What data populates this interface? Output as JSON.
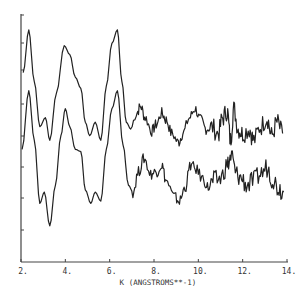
{
  "chart_data": {
    "type": "line",
    "title": "",
    "xlabel": "K (ANGSTROMS**-1)",
    "ylabel": "",
    "xlim": [
      2,
      14
    ],
    "x_ticks": [
      "2.",
      "4.",
      "6.",
      "8.",
      "10.",
      "12.",
      "14."
    ],
    "y_tick_count": 8,
    "grid": false,
    "legend": null,
    "series": [
      {
        "name": "upper curve",
        "points": [
          [
            2.1,
            8.4
          ],
          [
            2.35,
            10.3
          ],
          [
            2.6,
            8.0
          ],
          [
            2.85,
            6.0
          ],
          [
            3.1,
            6.4
          ],
          [
            3.3,
            5.4
          ],
          [
            3.6,
            7.5
          ],
          [
            3.95,
            9.6
          ],
          [
            4.2,
            9.2
          ],
          [
            4.45,
            8.2
          ],
          [
            4.7,
            7.7
          ],
          [
            4.9,
            6.2
          ],
          [
            5.1,
            5.6
          ],
          [
            5.35,
            6.2
          ],
          [
            5.6,
            5.4
          ],
          [
            5.85,
            7.8
          ],
          [
            6.1,
            9.7
          ],
          [
            6.35,
            10.3
          ],
          [
            6.55,
            8.0
          ],
          [
            6.75,
            6.2
          ],
          [
            6.95,
            5.9
          ],
          [
            7.2,
            6.6
          ],
          [
            7.4,
            6.9
          ],
          [
            7.6,
            6.4
          ],
          [
            7.9,
            5.8
          ],
          [
            8.1,
            6.1
          ],
          [
            8.35,
            6.6
          ],
          [
            8.55,
            6.3
          ],
          [
            8.8,
            5.7
          ],
          [
            9.1,
            5.3
          ],
          [
            9.3,
            5.7
          ],
          [
            9.6,
            6.4
          ],
          [
            9.85,
            6.8
          ],
          [
            10.1,
            6.3
          ],
          [
            10.35,
            5.9
          ],
          [
            10.6,
            6.0
          ],
          [
            10.9,
            5.7
          ],
          [
            11.1,
            6.4
          ],
          [
            11.3,
            6.7
          ],
          [
            11.45,
            5.4
          ],
          [
            11.6,
            6.8
          ],
          [
            11.8,
            5.9
          ],
          [
            12.0,
            5.7
          ],
          [
            12.3,
            5.9
          ],
          [
            12.5,
            5.4
          ],
          [
            12.8,
            6.0
          ],
          [
            13.1,
            6.4
          ],
          [
            13.3,
            5.6
          ],
          [
            13.55,
            6.2
          ],
          [
            13.8,
            5.7
          ]
        ]
      },
      {
        "name": "lower curve",
        "points": [
          [
            2.05,
            5.0
          ],
          [
            2.35,
            7.6
          ],
          [
            2.6,
            5.4
          ],
          [
            2.85,
            2.6
          ],
          [
            3.05,
            3.1
          ],
          [
            3.3,
            1.6
          ],
          [
            3.55,
            3.4
          ],
          [
            3.8,
            5.6
          ],
          [
            4.0,
            6.8
          ],
          [
            4.2,
            6.0
          ],
          [
            4.45,
            5.0
          ],
          [
            4.7,
            4.9
          ],
          [
            4.9,
            3.2
          ],
          [
            5.15,
            2.6
          ],
          [
            5.35,
            3.1
          ],
          [
            5.6,
            2.7
          ],
          [
            5.85,
            5.0
          ],
          [
            6.1,
            6.8
          ],
          [
            6.35,
            7.6
          ],
          [
            6.6,
            5.2
          ],
          [
            6.85,
            3.4
          ],
          [
            7.05,
            3.1
          ],
          [
            7.3,
            4.0
          ],
          [
            7.55,
            4.6
          ],
          [
            7.85,
            3.9
          ],
          [
            8.1,
            4.0
          ],
          [
            8.35,
            4.3
          ],
          [
            8.55,
            3.6
          ],
          [
            8.9,
            2.9
          ],
          [
            9.15,
            2.7
          ],
          [
            9.4,
            3.3
          ],
          [
            9.65,
            4.3
          ],
          [
            9.9,
            4.1
          ],
          [
            10.2,
            3.7
          ],
          [
            10.45,
            3.3
          ],
          [
            10.7,
            3.6
          ],
          [
            11.0,
            3.7
          ],
          [
            11.3,
            4.3
          ],
          [
            11.5,
            4.7
          ],
          [
            11.7,
            3.9
          ],
          [
            11.95,
            3.7
          ],
          [
            12.2,
            3.4
          ],
          [
            12.5,
            3.6
          ],
          [
            12.8,
            3.9
          ],
          [
            13.1,
            4.2
          ],
          [
            13.35,
            3.7
          ],
          [
            13.6,
            3.3
          ],
          [
            13.85,
            3.1
          ]
        ]
      }
    ]
  }
}
